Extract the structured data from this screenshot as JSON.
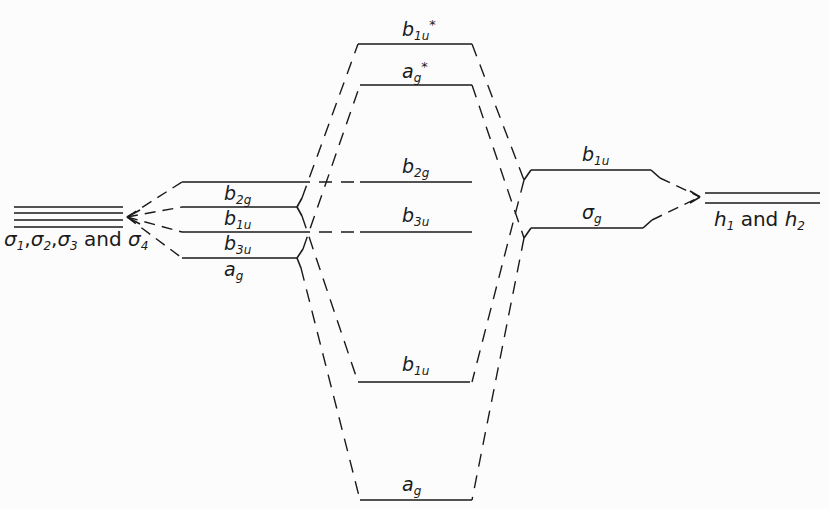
{
  "diagram": {
    "type": "molecular-orbital-energy-level-diagram",
    "left_fragment": {
      "label_parts": [
        "σ",
        "1",
        ",",
        "σ",
        "2",
        ",",
        "σ",
        "3",
        " and ",
        "σ",
        "4"
      ],
      "levels": 4
    },
    "left_mos": [
      {
        "sym": "b",
        "sub": "2g",
        "y": 182
      },
      {
        "sym": "b",
        "sub": "1u",
        "y": 207
      },
      {
        "sym": "b",
        "sub": "3u",
        "y": 232
      },
      {
        "sym": "a",
        "sub": "g",
        "y": 258
      }
    ],
    "center_mos": [
      {
        "sym": "b",
        "sub": "1u",
        "sup": "*",
        "y": 44
      },
      {
        "sym": "a",
        "sub": "g",
        "sup": "*",
        "y": 85
      },
      {
        "sym": "b",
        "sub": "2g",
        "y": 182
      },
      {
        "sym": "b",
        "sub": "3u",
        "y": 232
      },
      {
        "sym": "b",
        "sub": "1u",
        "y": 382
      },
      {
        "sym": "a",
        "sub": "g",
        "y": 500
      }
    ],
    "right_mos": [
      {
        "sym": "b",
        "sub": "1u",
        "y": 170
      },
      {
        "sym": "σ",
        "sub": "g",
        "y": 228
      }
    ],
    "right_fragment": {
      "label_parts": [
        "h",
        "1",
        " and ",
        "h",
        "2"
      ],
      "levels": 2
    }
  }
}
